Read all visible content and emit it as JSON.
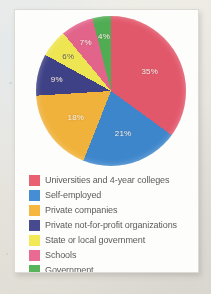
{
  "chart_data": {
    "type": "pie",
    "title": "",
    "labels": [
      "Universities and 4-year colleges",
      "Self-employed",
      "Private companies",
      "Private not-for-profit organizations",
      "State or local government",
      "Schools",
      "Government"
    ],
    "values": [
      35,
      21,
      18,
      9,
      6,
      7,
      4
    ],
    "value_labels": [
      "35%",
      "21%",
      "18%",
      "9%",
      "6%",
      "7%",
      "4%"
    ],
    "colors": [
      "#e8566a",
      "#3a87d0",
      "#f5b335",
      "#3c3f87",
      "#f2e84c",
      "#e8628c",
      "#4caf50"
    ],
    "legend_position": "bottom",
    "start_angle_deg": 0,
    "direction": "clockwise",
    "grid": false
  },
  "legend": {
    "items": [
      {
        "label": "Universities and 4-year colleges",
        "color": "#e8566a"
      },
      {
        "label": "Self-employed",
        "color": "#3a87d0"
      },
      {
        "label": "Private companies",
        "color": "#f5b335"
      },
      {
        "label": "Private not-for-profit organizations",
        "color": "#3c3f87"
      },
      {
        "label": "State or local government",
        "color": "#f2e84c"
      },
      {
        "label": "Schools",
        "color": "#e8628c"
      },
      {
        "label": "Government",
        "color": "#4caf50"
      }
    ]
  }
}
